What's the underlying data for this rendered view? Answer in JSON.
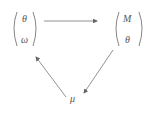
{
  "diagram": {
    "left_vector": {
      "top": "θ",
      "bottom": "ω"
    },
    "right_vector": {
      "top": "M",
      "bottom": "θ"
    },
    "bottom_node": "μ",
    "edges": [
      {
        "from": "left_vector",
        "to": "right_vector"
      },
      {
        "from": "right_vector",
        "to": "bottom_node"
      },
      {
        "from": "bottom_node",
        "to": "left_vector"
      }
    ],
    "colors": {
      "stroke": "#777777",
      "text": "#555555"
    }
  }
}
